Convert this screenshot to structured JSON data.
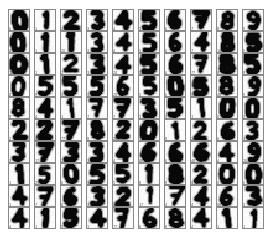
{
  "figure": {
    "kind": "digit-thumbnail-grid",
    "rows": 10,
    "columns": 10,
    "cell_border_color": "#8a8a8a",
    "cell_background_color": "#fdfdfd",
    "page_background_color": "#ffffff",
    "ink_color": "#000000",
    "label_color": "#5a5a5a"
  },
  "grid": {
    "rows": [
      {
        "cells": [
          {
            "digit": "0",
            "label": "0"
          },
          {
            "digit": "1",
            "label": "1"
          },
          {
            "digit": "2",
            "label": "2"
          },
          {
            "digit": "3",
            "label": "3"
          },
          {
            "digit": "4",
            "label": "4"
          },
          {
            "digit": "5",
            "label": "5"
          },
          {
            "digit": "6",
            "label": "6"
          },
          {
            "digit": "7",
            "label": "7"
          },
          {
            "digit": "8",
            "label": "8"
          },
          {
            "digit": "9",
            "label": "9"
          }
        ]
      },
      {
        "cells": [
          {
            "digit": "0",
            "label": "0"
          },
          {
            "digit": "1",
            "label": "1"
          },
          {
            "digit": "1",
            "label": "20"
          },
          {
            "digit": "3",
            "label": "3"
          },
          {
            "digit": "4",
            "label": "4"
          },
          {
            "digit": "5",
            "label": "5"
          },
          {
            "digit": "6",
            "label": "6"
          },
          {
            "digit": "4",
            "label": "7"
          },
          {
            "digit": "8",
            "label": "10"
          },
          {
            "digit": "5",
            "label": "9"
          }
        ]
      },
      {
        "cells": [
          {
            "digit": "0",
            "label": "10"
          },
          {
            "digit": "1",
            "label": "1"
          },
          {
            "digit": "2",
            "label": "2"
          },
          {
            "digit": "3",
            "label": "3"
          },
          {
            "digit": "4",
            "label": "24"
          },
          {
            "digit": "5",
            "label": "5"
          },
          {
            "digit": "6",
            "label": "6"
          },
          {
            "digit": "7",
            "label": "77"
          },
          {
            "digit": "8",
            "label": "8"
          },
          {
            "digit": "5",
            "label": "9"
          }
        ]
      },
      {
        "cells": [
          {
            "digit": "0",
            "label": "0"
          },
          {
            "digit": "5",
            "label": "9"
          },
          {
            "digit": "5",
            "label": "5"
          },
          {
            "digit": "5",
            "label": "5"
          },
          {
            "digit": "6",
            "label": "25"
          },
          {
            "digit": "5",
            "label": "5"
          },
          {
            "digit": "0",
            "label": "0"
          },
          {
            "digit": "5",
            "label": "9"
          },
          {
            "digit": "8",
            "label": "46"
          },
          {
            "digit": "9",
            "label": "9"
          }
        ]
      },
      {
        "cells": [
          {
            "digit": "8",
            "label": "8"
          },
          {
            "digit": "4",
            "label": "4"
          },
          {
            "digit": "1",
            "label": "1"
          },
          {
            "digit": "7",
            "label": "7"
          },
          {
            "digit": "7",
            "label": "7"
          },
          {
            "digit": "3",
            "label": "3"
          },
          {
            "digit": "5",
            "label": "5"
          },
          {
            "digit": "1",
            "label": "1"
          },
          {
            "digit": "0",
            "label": "0"
          },
          {
            "digit": "0",
            "label": "2"
          }
        ]
      },
      {
        "cells": [
          {
            "digit": "2",
            "label": "2"
          },
          {
            "digit": "2",
            "label": "26"
          },
          {
            "digit": "7",
            "label": "77"
          },
          {
            "digit": "8",
            "label": "8"
          },
          {
            "digit": "2",
            "label": "26"
          },
          {
            "digit": "0",
            "label": "1"
          },
          {
            "digit": "1",
            "label": "8"
          },
          {
            "digit": "2",
            "label": "26"
          },
          {
            "digit": "6",
            "label": "6"
          },
          {
            "digit": "3",
            "label": "3"
          }
        ]
      },
      {
        "cells": [
          {
            "digit": "3",
            "label": "3"
          },
          {
            "digit": "7",
            "label": "17"
          },
          {
            "digit": "3",
            "label": "2"
          },
          {
            "digit": "3",
            "label": "3"
          },
          {
            "digit": "4",
            "label": "4"
          },
          {
            "digit": "6",
            "label": "66"
          },
          {
            "digit": "6",
            "label": "6"
          },
          {
            "digit": "6",
            "label": "46"
          },
          {
            "digit": "4",
            "label": "4"
          },
          {
            "digit": "9",
            "label": "20"
          }
        ]
      },
      {
        "cells": [
          {
            "digit": "1",
            "label": "1"
          },
          {
            "digit": "5",
            "label": "25"
          },
          {
            "digit": "0",
            "label": "6"
          },
          {
            "digit": "5",
            "label": "9"
          },
          {
            "digit": "5",
            "label": "5"
          },
          {
            "digit": "1",
            "label": "8"
          },
          {
            "digit": "8",
            "label": "8"
          },
          {
            "digit": "2",
            "label": "6"
          },
          {
            "digit": "0",
            "label": "0"
          },
          {
            "digit": "0",
            "label": "0"
          }
        ]
      },
      {
        "cells": [
          {
            "digit": "4",
            "label": "1"
          },
          {
            "digit": "7",
            "label": "7"
          },
          {
            "digit": "6",
            "label": "6"
          },
          {
            "digit": "3",
            "label": "3"
          },
          {
            "digit": "2",
            "label": "1"
          },
          {
            "digit": "1",
            "label": "17"
          },
          {
            "digit": "7",
            "label": "4"
          },
          {
            "digit": "4",
            "label": "4"
          },
          {
            "digit": "6",
            "label": "66"
          },
          {
            "digit": "3",
            "label": "3"
          }
        ]
      },
      {
        "cells": [
          {
            "digit": "4",
            "label": "4"
          },
          {
            "digit": "1",
            "label": "1"
          },
          {
            "digit": "5",
            "label": "5"
          },
          {
            "digit": "4",
            "label": "1"
          },
          {
            "digit": "7",
            "label": "77"
          },
          {
            "digit": "6",
            "label": "6"
          },
          {
            "digit": "8",
            "label": "8"
          },
          {
            "digit": "4",
            "label": "4"
          },
          {
            "digit": "1",
            "label": "1"
          },
          {
            "digit": "1",
            "label": "1"
          }
        ]
      }
    ]
  }
}
